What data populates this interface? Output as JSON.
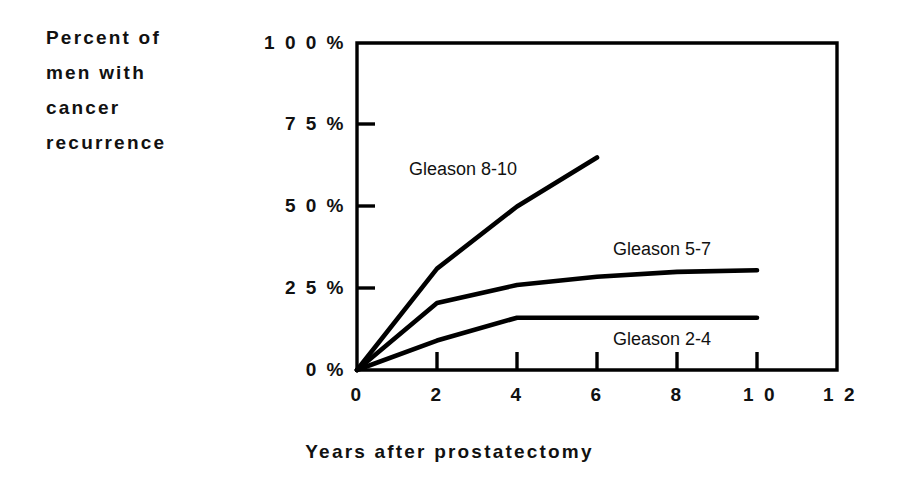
{
  "chart_data": {
    "type": "line",
    "title": "",
    "subtitle": "",
    "xlabel": "Years after prostatectomy",
    "ylabel": "Percent of men with cancer recurrence",
    "ylabel_lines": [
      "Percent of",
      "men with",
      "cancer",
      "recurrence"
    ],
    "x": [
      0,
      2,
      4,
      6,
      8,
      10
    ],
    "xlim": [
      0,
      12
    ],
    "ylim": [
      0,
      100
    ],
    "xticks": [
      0,
      2,
      4,
      6,
      8,
      10,
      12
    ],
    "xtick_labels": [
      "0",
      "2",
      "4",
      "6",
      "8",
      "1 0",
      "1 2"
    ],
    "yticks": [
      0,
      25,
      50,
      75,
      100
    ],
    "ytick_labels": [
      "0 %",
      "2 5 %",
      "5 0 %",
      "7 5 %",
      "1 0 0 %"
    ],
    "grid": false,
    "legend_position": "inline-annotations",
    "series": [
      {
        "name": "Gleason 8-10",
        "label": "Gleason 8-10",
        "x": [
          0,
          2,
          4,
          6
        ],
        "values": [
          0,
          31,
          50,
          65
        ],
        "color": "#000000"
      },
      {
        "name": "Gleason 5-7",
        "label": "Gleason 5-7",
        "x": [
          0,
          2,
          4,
          6,
          8,
          10
        ],
        "values": [
          0,
          20.5,
          26,
          28.5,
          30,
          30.5
        ],
        "color": "#000000"
      },
      {
        "name": "Gleason 2-4",
        "label": "Gleason 2-4",
        "x": [
          0,
          2,
          4,
          6,
          8,
          10
        ],
        "values": [
          0,
          9,
          16,
          16,
          16,
          16
        ],
        "color": "#000000"
      }
    ]
  },
  "axis": {
    "frame_color": "#000000",
    "line_color": "#000000",
    "background": "#ffffff"
  }
}
